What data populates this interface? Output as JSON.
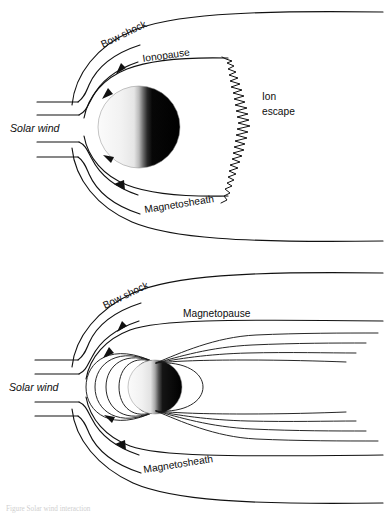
{
  "figure": {
    "background_color": "#ffffff",
    "line_color": "#111111",
    "text_color": "#0d0d0d",
    "width": 385,
    "height": 514
  },
  "panel_top": {
    "name": "unmagnetized-planet-interaction",
    "labels": {
      "bow_shock": "Bow shock",
      "ionopause": "Ionopause",
      "ion_escape_line1": "Ion",
      "ion_escape_line2": "escape",
      "solar_wind": "Solar wind",
      "magnetosheath": "Magnetosheath"
    },
    "planet": {
      "name": "planet-disk",
      "dayside_shade": "#f0f0f0",
      "nightside_shade": "#000000",
      "cx": 139,
      "cy": 127,
      "r": 41
    },
    "streamline_count": 4,
    "arrow_count": 4
  },
  "panel_bottom": {
    "name": "magnetized-planet-magnetosphere",
    "labels": {
      "bow_shock": "Bow shock",
      "magnetopause": "Magnetopause",
      "solar_wind": "Solar wind",
      "magnetosheath": "Magnetosheath"
    },
    "planet": {
      "name": "planet-disk",
      "dayside_shade": "#f0f0f0",
      "nightside_shade": "#000000",
      "cx": 155,
      "cy": 130,
      "r": 27
    },
    "closed_field_loops": 5,
    "tail_lines_north": 4,
    "tail_lines_south": 4,
    "streamline_count": 4,
    "arrow_count": 4
  },
  "caption": {
    "text": "Figure   Solar wind interaction"
  }
}
